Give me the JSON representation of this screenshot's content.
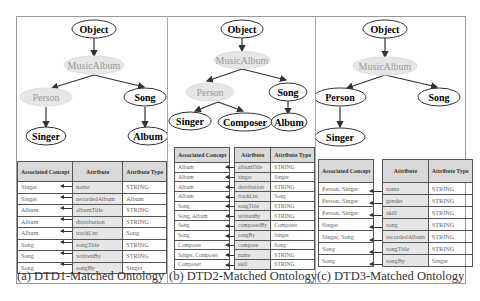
{
  "panels": [
    {
      "caption": "(a) DTD1-Matched Ontology",
      "tree": {
        "nodes": [
          {
            "id": "object",
            "label": "Object",
            "style": "normal"
          },
          {
            "id": "musicalbum",
            "label": "MusicAlbum",
            "style": "shaded"
          },
          {
            "id": "person",
            "label": "Person",
            "style": "shaded"
          },
          {
            "id": "song",
            "label": "Song",
            "style": "normal"
          },
          {
            "id": "singer",
            "label": "Singer",
            "style": "normal"
          },
          {
            "id": "album",
            "label": "Album",
            "style": "normal"
          }
        ]
      },
      "table": {
        "headers": {
          "concept": "Associated Concept",
          "attribute": "Attribute",
          "type": "Attribute Type"
        },
        "rows": [
          {
            "concept": "Singer",
            "attribute": "name",
            "type": "STRING"
          },
          {
            "concept": "Singer",
            "attribute": "recordedAlbum",
            "type": "Album"
          },
          {
            "concept": "Album",
            "attribute": "albumTitle",
            "type": "STRING"
          },
          {
            "concept": "Album",
            "attribute": "distribution",
            "type": "STRING"
          },
          {
            "concept": "Album",
            "attribute": "trackList",
            "type": "Song"
          },
          {
            "concept": "Song",
            "attribute": "songTitle",
            "type": "STRING"
          },
          {
            "concept": "Song",
            "attribute": "writtenBy",
            "type": "STRING"
          },
          {
            "concept": "Song",
            "attribute": "songBy",
            "type": "Singer"
          }
        ]
      }
    },
    {
      "caption": "(b) DTD2-Matched Ontology",
      "tree": {
        "nodes": [
          {
            "id": "object",
            "label": "Object",
            "style": "normal"
          },
          {
            "id": "musicalbum",
            "label": "MusicAlbum",
            "style": "shaded"
          },
          {
            "id": "person",
            "label": "Person",
            "style": "shaded"
          },
          {
            "id": "song",
            "label": "Song",
            "style": "normal"
          },
          {
            "id": "singer",
            "label": "Singer",
            "style": "normal"
          },
          {
            "id": "composer",
            "label": "Composer",
            "style": "normal"
          },
          {
            "id": "album",
            "label": "Album",
            "style": "normal"
          }
        ]
      },
      "table": {
        "headers": {
          "concept": "Associated Concept",
          "attribute": "Attribute",
          "type": "Attribute Type"
        },
        "rows": [
          {
            "concept": "Album",
            "attribute": "albumTitle",
            "type": "STRING"
          },
          {
            "concept": "Album",
            "attribute": "singer",
            "type": "Singer"
          },
          {
            "concept": "Album",
            "attribute": "distribution",
            "type": "STRING"
          },
          {
            "concept": "Album",
            "attribute": "trackList",
            "type": "Song"
          },
          {
            "concept": "Song",
            "attribute": "songTitle",
            "type": "STRING"
          },
          {
            "concept": "Song, Album",
            "attribute": "writtenBy",
            "type": "STRING"
          },
          {
            "concept": "Song",
            "attribute": "composedBy",
            "type": "Composer"
          },
          {
            "concept": "Song",
            "attribute": "songBy",
            "type": "Singer"
          },
          {
            "concept": "Composer",
            "attribute": "compose",
            "type": "Song"
          },
          {
            "concept": "Singer, Composer",
            "attribute": "name",
            "type": "STRING"
          },
          {
            "concept": "Composer",
            "attribute": "skill",
            "type": "STRING"
          }
        ]
      }
    },
    {
      "caption": "(c) DTD3-Matched Ontology",
      "tree": {
        "nodes": [
          {
            "id": "object",
            "label": "Object",
            "style": "normal"
          },
          {
            "id": "musicalbum",
            "label": "MusicAlbum",
            "style": "shaded"
          },
          {
            "id": "person",
            "label": "Person",
            "style": "normal"
          },
          {
            "id": "song",
            "label": "Song",
            "style": "normal"
          },
          {
            "id": "singer",
            "label": "Singer",
            "style": "normal"
          }
        ]
      },
      "table": {
        "headers": {
          "concept": "Associated Concept",
          "attribute": "Attribute",
          "type": "Attribute Type"
        },
        "rows": [
          {
            "concept": "Person, Singer",
            "attribute": "name",
            "type": "STRING"
          },
          {
            "concept": "Person, Singer",
            "attribute": "gender",
            "type": "STRING"
          },
          {
            "concept": "Person, Singer",
            "attribute": "skill",
            "type": "STRING"
          },
          {
            "concept": "Singer",
            "attribute": "song",
            "type": "STRING"
          },
          {
            "concept": "Singer, Song",
            "attribute": "recordedAlbum",
            "type": "STRING"
          },
          {
            "concept": "Song",
            "attribute": "songTitle",
            "type": "STRING"
          },
          {
            "concept": "Song",
            "attribute": "songBy",
            "type": "Singer"
          }
        ]
      }
    }
  ]
}
